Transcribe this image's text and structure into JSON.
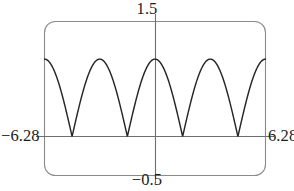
{
  "figure": {
    "name": "graphing-calculator-plot",
    "frame": {
      "border_color": "#8a8a8a",
      "fill_color": "#ffffff",
      "corner_radius": 11,
      "left": 44,
      "top": 21,
      "right": 266,
      "bottom": 176
    },
    "axis_color": "#6f6f6f",
    "curve_color": "#262626",
    "text_color": "#1c1c1c"
  },
  "labels": {
    "y_max": "1.5",
    "y_min": "−0.5",
    "x_min": "−6.28",
    "x_max": "6.28"
  },
  "chart_data": {
    "type": "line",
    "title": "",
    "xlabel": "",
    "ylabel": "",
    "xlim": [
      -6.28,
      6.28
    ],
    "ylim": [
      -0.5,
      1.5
    ],
    "grid": false,
    "legend": null,
    "x_tick_labels": [
      "−6.28",
      "6.28"
    ],
    "y_tick_labels": [
      "−0.5",
      "1.5"
    ],
    "axis_origin": [
      0,
      0
    ],
    "series": [
      {
        "name": "|cos(x)|",
        "expression": "abs(cos(x))",
        "x": [
          -6.28,
          -6.0,
          -5.7,
          -5.4,
          -5.1,
          -4.8,
          -4.5,
          -4.712389,
          -4.4,
          -4.1,
          -3.8,
          -3.5,
          -3.141593,
          -2.8,
          -2.5,
          -2.2,
          -1.9,
          -1.570796,
          -1.3,
          -1.0,
          -0.7,
          -0.4,
          0.0,
          0.4,
          0.7,
          1.0,
          1.3,
          1.570796,
          1.9,
          2.2,
          2.5,
          2.8,
          3.141593,
          3.5,
          3.8,
          4.1,
          4.4,
          4.712389,
          5.1,
          5.4,
          5.7,
          6.0,
          6.28
        ],
        "y": [
          1.0,
          0.96,
          0.835,
          0.635,
          0.378,
          0.087,
          0.211,
          0.0,
          0.307,
          0.575,
          0.791,
          0.936,
          1.0,
          0.942,
          0.801,
          0.589,
          0.323,
          0.0,
          0.268,
          0.54,
          0.765,
          0.921,
          1.0,
          0.921,
          0.765,
          0.54,
          0.268,
          0.0,
          0.323,
          0.589,
          0.801,
          0.942,
          1.0,
          0.936,
          0.791,
          0.575,
          0.307,
          0.0,
          0.378,
          0.635,
          0.835,
          0.96,
          1.0
        ],
        "peaks_x": [
          -6.283185,
          -3.141593,
          0.0,
          3.141593,
          6.283185
        ],
        "peak_value": 1.0,
        "zeros_x": [
          -4.712389,
          -1.570796,
          1.570796,
          4.712389
        ]
      }
    ]
  }
}
